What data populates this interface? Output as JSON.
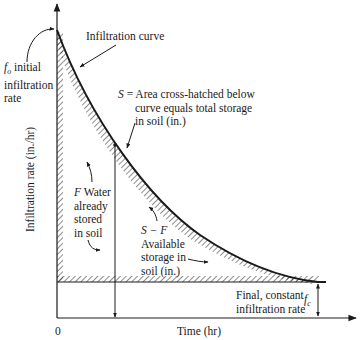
{
  "diagram": {
    "axes": {
      "y_label": "Infiltration rate (in./hr)",
      "x_label": "Time (hr)",
      "origin_label": "0"
    },
    "labels": {
      "curve": "Infiltration curve",
      "f0_symbol": "f",
      "f0_sub": "o",
      "f0_text_1": " initial",
      "f0_text_2": "infiltration",
      "f0_text_3": "rate",
      "s_symbol": "S",
      "s_text_1": " = Area cross-hatched below",
      "s_text_2": "curve equals total storage",
      "s_text_3": "in soil (in.)",
      "f_symbol": "F",
      "f_text_1": " Water",
      "f_text_2": "already",
      "f_text_3": "stored",
      "f_text_4": "in soil",
      "sf_symbol": "S − F",
      "sf_text_1": "Available",
      "sf_text_2": "storage in",
      "sf_text_3": "soil (in.)",
      "final_text_1": "Final, constant",
      "final_text_2": "infiltration rate",
      "fc_symbol": "f",
      "fc_sub": "c"
    },
    "colors": {
      "ink": "#1a1a1a",
      "background": "#ffffff"
    }
  }
}
